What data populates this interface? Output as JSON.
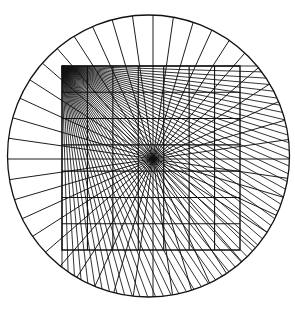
{
  "figure": {
    "canvas": {
      "width": 295,
      "height": 311
    },
    "background_color": "#ffffff",
    "stroke_color": "#111111"
  },
  "circle": {
    "name": "bounding-circle",
    "cx": 148.5,
    "cy": 156,
    "r": 141,
    "stroke_width": 1.3,
    "fill": "none",
    "left_edge_x": 13,
    "right_edge_x": 284,
    "top_edge_y": 15,
    "bottom_edge_y": 297
  },
  "square_grid": {
    "name": "square-grid",
    "left": 62,
    "top": 66,
    "right": 240,
    "bottom": 250,
    "cols": 7,
    "rows": 7,
    "stroke_width": 1.1,
    "cell_width": 25.43,
    "cell_height": 26.29,
    "border_stroke_width": 1.4
  },
  "fans": [
    {
      "name": "corner-fan",
      "label": "Dense fan from top-left grid corner",
      "origin_x": 62,
      "origin_y": 66,
      "ray_count": 54,
      "angle_start_deg": 0,
      "angle_end_deg": 90,
      "stroke_width": 0.85,
      "dense": true
    },
    {
      "name": "center-fan",
      "label": "Radial fan from grid center",
      "origin_x": 153,
      "origin_y": 159,
      "ray_count": 44,
      "angle_start_deg": 0,
      "angle_end_deg": 360,
      "stroke_width": 0.95,
      "dense": false
    }
  ],
  "chart_data": {
    "type": "scatter",
    "xlabel": "",
    "ylabel": "",
    "grid": true,
    "legend": "none",
    "xlim": [
      0,
      295
    ],
    "ylim": [
      0,
      311
    ],
    "elements": [
      {
        "kind": "circle",
        "cx": 148.5,
        "cy": 156,
        "r": 141
      },
      {
        "kind": "square",
        "x": 62,
        "y": 66,
        "w": 178,
        "h": 184,
        "divisions": 7
      },
      {
        "kind": "ray-fan",
        "origin": [
          62,
          66
        ],
        "rays": 54,
        "span_deg": 90
      },
      {
        "kind": "ray-fan",
        "origin": [
          153,
          159
        ],
        "rays": 44,
        "span_deg": 360
      }
    ]
  }
}
